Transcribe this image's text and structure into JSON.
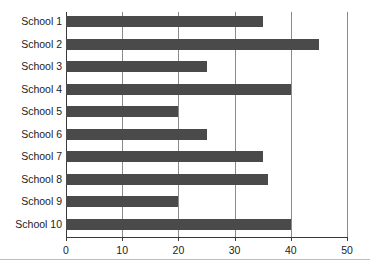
{
  "chart_data": {
    "type": "bar",
    "orientation": "horizontal",
    "title": "",
    "subtitle": "",
    "xlabel": "",
    "ylabel": "",
    "categories": [
      "School 1",
      "School 2",
      "School 3",
      "School 4",
      "School 5",
      "School 6",
      "School 7",
      "School 8",
      "School 9",
      "School 10"
    ],
    "values": [
      35,
      45,
      25,
      40,
      20,
      25,
      35,
      36,
      20,
      40
    ],
    "xlim": [
      0,
      50
    ],
    "xticks": [
      0,
      10,
      20,
      30,
      40,
      50
    ],
    "xtick_labels": [
      "0",
      "10",
      "20",
      "30",
      "40",
      "50"
    ],
    "grid": "vertical",
    "legend": "none",
    "annotations": []
  },
  "style": {
    "bar_color": "#4a4a4a",
    "gridline_color": "#8a8a8a",
    "axis_color": "#3a3a3a",
    "text_color": "#1c1c1c",
    "background": "#ffffff",
    "rule_color": "#bdbdbd"
  }
}
